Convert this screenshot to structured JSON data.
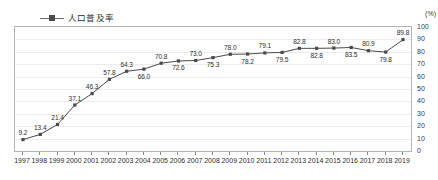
{
  "chart_data": {
    "type": "line",
    "title": "",
    "xlabel": "",
    "ylabel": "(%)",
    "unit_label": "(%)",
    "legend_position": "top-left",
    "grid": true,
    "ylim": [
      0,
      100
    ],
    "y_ticks": [
      0,
      10,
      20,
      30,
      40,
      50,
      60,
      70,
      80,
      90,
      100
    ],
    "categories": [
      "1997",
      "1998",
      "1999",
      "2000",
      "2001",
      "2002",
      "2003",
      "2004",
      "2005",
      "2006",
      "2007",
      "2008",
      "2009",
      "2010",
      "2011",
      "2012",
      "2013",
      "2014",
      "2015",
      "2016",
      "2017",
      "2018",
      "2019"
    ],
    "series": [
      {
        "name": "人口普及率",
        "color": "#4a4a4a",
        "values": [
          9.2,
          13.4,
          21.4,
          37.1,
          46.3,
          57.8,
          64.3,
          66.0,
          70.8,
          72.6,
          73.0,
          75.3,
          78.0,
          78.2,
          79.1,
          79.5,
          82.8,
          82.8,
          83.0,
          83.5,
          80.9,
          79.8,
          89.8
        ]
      }
    ],
    "point_labels": [
      "9.2",
      "13.4",
      "21.4",
      "37.1",
      "46.3",
      "57.8",
      "64.3",
      "66.0",
      "70.8",
      "72.6",
      "73.0",
      "75.3",
      "78.0",
      "78.2",
      "79.1",
      "79.5",
      "82.8",
      "82.8",
      "83.0",
      "83.5",
      "80.9",
      "79.8",
      "89.8"
    ],
    "point_label_side": [
      "above",
      "above",
      "above",
      "above",
      "above",
      "above",
      "above",
      "below",
      "above",
      "below",
      "above",
      "below",
      "above",
      "below",
      "above",
      "below",
      "above",
      "below",
      "above",
      "below",
      "above",
      "below",
      "above"
    ]
  },
  "legend": {
    "label": "人口普及率"
  },
  "axis": {
    "y_unit": "(%)"
  }
}
